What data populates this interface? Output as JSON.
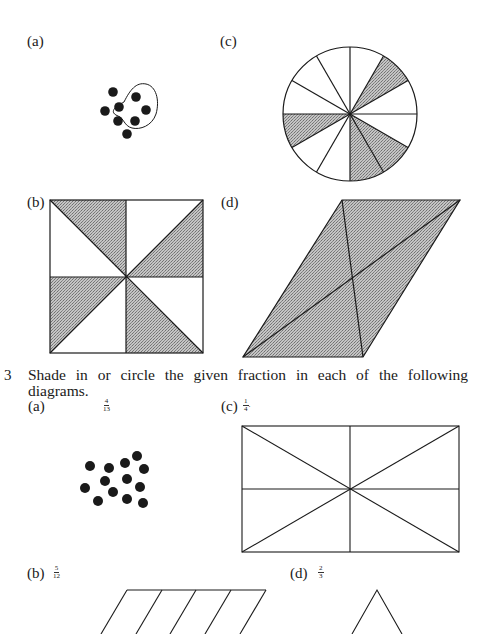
{
  "exercise_2": {
    "parts": [
      {
        "label": "(a)",
        "figure": "dot-group",
        "dots": 8,
        "circled": 5
      },
      {
        "label": "(b)",
        "figure": "square-8-triangles",
        "sections": 8,
        "shaded": 4
      },
      {
        "label": "(c)",
        "figure": "circle-12-sectors",
        "sections": 12,
        "shaded": 4
      },
      {
        "label": "(d)",
        "figure": "parallelogram-4-triangles",
        "sections": 4,
        "shaded": 4
      }
    ]
  },
  "exercise_3": {
    "number": "3",
    "instruction_line1": "Shade in or circle the given fraction in each of the following",
    "instruction_line2": "diagrams.",
    "parts": [
      {
        "label": "(a)",
        "fraction": {
          "num": "4",
          "den": "13"
        },
        "figure": "dot-group",
        "dots": 13
      },
      {
        "label": "(b)",
        "fraction": {
          "num": "5",
          "den": "12"
        },
        "figure": "parallelogram-strips"
      },
      {
        "label": "(c)",
        "fraction": {
          "num": "1",
          "den": "4"
        },
        "suffix": ".",
        "figure": "rectangle-8-triangles"
      },
      {
        "label": "(d)",
        "fraction": {
          "num": "2",
          "den": "3"
        },
        "figure": "triangle"
      }
    ]
  },
  "colors": {
    "ink": "#1a1a1a",
    "shade": "#a8a8a8",
    "paper": "#ffffff"
  }
}
